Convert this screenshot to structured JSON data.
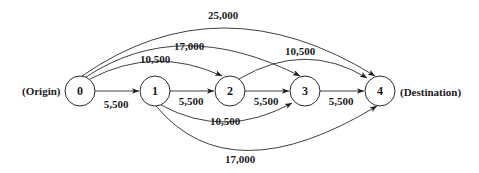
{
  "diagram": {
    "type": "network",
    "origin_label": "(Origin)",
    "destination_label": "(Destination)",
    "nodes": [
      {
        "id": "0",
        "label": "0"
      },
      {
        "id": "1",
        "label": "1"
      },
      {
        "id": "2",
        "label": "2"
      },
      {
        "id": "3",
        "label": "3"
      },
      {
        "id": "4",
        "label": "4"
      }
    ],
    "edges": [
      {
        "from": "0",
        "to": "1",
        "label": "5,500"
      },
      {
        "from": "1",
        "to": "2",
        "label": "5,500"
      },
      {
        "from": "2",
        "to": "3",
        "label": "5,500"
      },
      {
        "from": "3",
        "to": "4",
        "label": "5,500"
      },
      {
        "from": "0",
        "to": "2",
        "label": "10,500"
      },
      {
        "from": "0",
        "to": "3",
        "label": "17,000"
      },
      {
        "from": "0",
        "to": "4",
        "label": "25,000"
      },
      {
        "from": "1",
        "to": "3",
        "label": "10,500"
      },
      {
        "from": "1",
        "to": "4",
        "label": "17,000"
      },
      {
        "from": "2",
        "to": "4",
        "label": "10,500"
      }
    ]
  }
}
